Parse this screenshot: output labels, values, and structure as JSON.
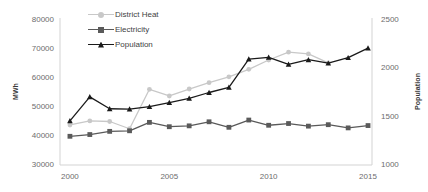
{
  "chart_data": {
    "type": "line",
    "title": "",
    "xlabel": "",
    "ylabel": "MWh",
    "y2label": "Population",
    "x": [
      2000,
      2001,
      2002,
      2003,
      2004,
      2005,
      2006,
      2007,
      2008,
      2009,
      2010,
      2011,
      2012,
      2013,
      2014,
      2015
    ],
    "xlim": [
      1999.5,
      2015.2
    ],
    "xticks": [
      2000,
      2005,
      2010,
      2015
    ],
    "xtick_labels": [
      "2000",
      "2005",
      "2010",
      "2015"
    ],
    "ylim": [
      30000,
      80000
    ],
    "yticks": [
      30000,
      40000,
      50000,
      60000,
      70000,
      80000
    ],
    "ytick_labels": [
      "30000",
      "40000",
      "50000",
      "60000",
      "70000",
      "80000"
    ],
    "y2lim": [
      1000,
      2500
    ],
    "y2ticks": [
      1000,
      1500,
      2000,
      2500
    ],
    "y2tick_labels": [
      "1000",
      "1500",
      "2000",
      "2500"
    ],
    "grid": false,
    "legend_position": "top-left",
    "series": [
      {
        "name": "District Heat",
        "axis": "left",
        "color": "#c8c8c8",
        "marker": "circle",
        "values": [
          43800,
          45200,
          45000,
          42500,
          56100,
          53800,
          56200,
          58400,
          60400,
          63000,
          66200,
          68900,
          68300,
          65200,
          null,
          null
        ]
      },
      {
        "name": "Electricity",
        "axis": "left",
        "color": "#5a5a5a",
        "marker": "square",
        "values": [
          39900,
          40500,
          41600,
          41800,
          44700,
          43200,
          43500,
          44900,
          43000,
          45500,
          43700,
          44300,
          43400,
          43900,
          42800,
          43600
        ]
      },
      {
        "name": "Population",
        "axis": "left",
        "color": "#1a1a1a",
        "marker": "triangle",
        "values": [
          45200,
          53500,
          49400,
          49300,
          50100,
          51500,
          53000,
          55000,
          56800,
          66500,
          67100,
          64700,
          66300,
          65100,
          67000,
          70300
        ]
      }
    ]
  },
  "legend": {
    "items": [
      {
        "label": "District Heat"
      },
      {
        "label": "Electricity"
      },
      {
        "label": "Population"
      }
    ]
  }
}
